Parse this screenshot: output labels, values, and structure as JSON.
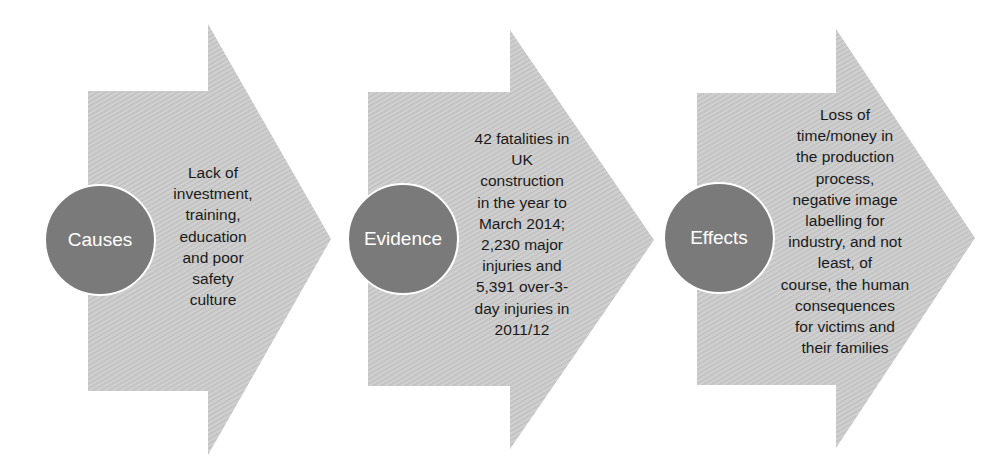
{
  "diagram": {
    "type": "process-flow",
    "colors": {
      "arrow_fill": "#cfcfcf",
      "arrow_texture": "#bdbdbd",
      "circle_fill": "#7a7a7a",
      "circle_border": "#ffffff",
      "circle_text": "#ffffff",
      "body_text": "#1a1a1a"
    },
    "steps": [
      {
        "label": "Causes",
        "lines": [
          "Lack of",
          "investment,",
          "training,",
          "education",
          "and poor",
          "safety",
          "culture"
        ]
      },
      {
        "label": "Evidence",
        "lines": [
          "42 fatalities in",
          "UK",
          "construction",
          "in the year to",
          "March 2014;",
          "2,230 major",
          "injuries and",
          "5,391 over-3-",
          "day injuries in",
          "2011/12"
        ]
      },
      {
        "label": "Effects",
        "lines": [
          "Loss of",
          "time/money in",
          "the production",
          "process,",
          "negative image",
          "labelling for",
          "industry, and not",
          "least, of",
          "course, the human",
          "consequences",
          "for victims and",
          "their families"
        ]
      }
    ]
  }
}
